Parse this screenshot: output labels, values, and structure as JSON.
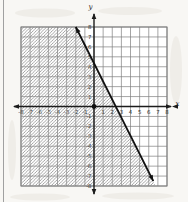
{
  "page": {
    "background_color": "#f8f7f4",
    "left_border_color": "#a0a0a0"
  },
  "chart_data": {
    "type": "line",
    "subtype": "linear-inequality-region-graph",
    "title": "",
    "xlabel": "x",
    "ylabel": "y",
    "xlim": [
      -8,
      8
    ],
    "ylim": [
      -8,
      8
    ],
    "grid": true,
    "x_ticks": [
      -8,
      -7,
      -6,
      -5,
      -4,
      -3,
      -2,
      -1,
      1,
      2,
      3,
      4,
      5,
      6,
      7,
      8
    ],
    "y_ticks": [
      -8,
      -7,
      -6,
      -5,
      -4,
      -3,
      -2,
      -1,
      1,
      2,
      3,
      4,
      5,
      6,
      7,
      8
    ],
    "boundary_line": {
      "style": "solid",
      "arrows": "both",
      "points": [
        [
          -2,
          8
        ],
        [
          6.5,
          -7.5
        ]
      ],
      "approx_equation": "y = -2x + 4"
    },
    "shaded_region": {
      "side": "left-of-line",
      "satisfies": "y <= -2x + 4",
      "pattern": "diagonal-hatch"
    },
    "plotted_point": [
      0,
      0
    ],
    "colors": {
      "axis": "#1c1c1c",
      "grid": "#7e7e7e",
      "hatch": "#8f8f8f",
      "line": "#101010",
      "label": "#2d2d2d",
      "panel": "#ffffff",
      "texture": "#e9e6e0"
    }
  }
}
